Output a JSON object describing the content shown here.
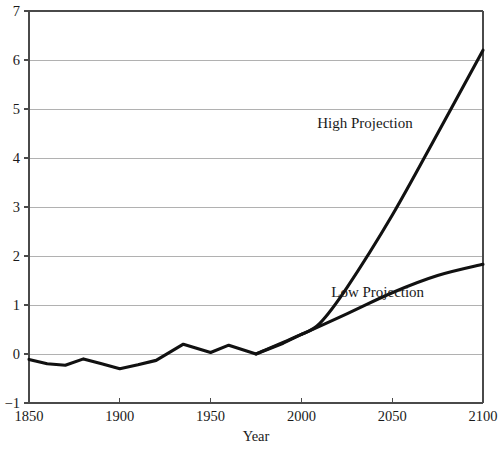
{
  "chart_data": {
    "type": "line",
    "title": "",
    "subtitle": "",
    "xlabel": "Year",
    "ylabel": "",
    "xlim": [
      1850,
      2100
    ],
    "ylim": [
      -1,
      7
    ],
    "grid": true,
    "grid_axis": "y",
    "legend_position": "inline-annotation",
    "x_ticks": [
      1850,
      1900,
      1950,
      2000,
      2050,
      2100
    ],
    "x_tick_labels": [
      "1850",
      "1900",
      "1950",
      "2000",
      "2050",
      "2100"
    ],
    "y_ticks": [
      -1,
      0,
      1,
      2,
      3,
      4,
      5,
      6,
      7
    ],
    "y_tick_labels": [
      "−1",
      "0",
      "1",
      "2",
      "3",
      "4",
      "5",
      "6",
      "7"
    ],
    "line_color": "#111111",
    "gridline_color": "#a9a9a9",
    "axis_color": "#4a4a4a",
    "background_color": "#ffffff",
    "series": [
      {
        "name": "Observed",
        "annotation": "",
        "x": [
          1850,
          1860,
          1870,
          1880,
          1890,
          1900,
          1910,
          1920,
          1935,
          1950,
          1960,
          1975,
          1990,
          2000
        ],
        "values": [
          -0.11,
          -0.2,
          -0.23,
          -0.1,
          -0.2,
          -0.3,
          -0.22,
          -0.13,
          0.2,
          0.03,
          0.18,
          0.0,
          0.22,
          0.4
        ]
      },
      {
        "name": "High Projection",
        "annotation": "High Projection",
        "annotation_x": 2035,
        "annotation_y": 4.62,
        "x": [
          2000,
          2010,
          2025,
          2050,
          2075,
          2100
        ],
        "values": [
          0.4,
          0.62,
          1.35,
          2.83,
          4.5,
          6.2
        ]
      },
      {
        "name": "Low Projection",
        "annotation": "Low Projection",
        "annotation_x": 2042,
        "annotation_y": 1.17,
        "x": [
          1975,
          2000,
          2025,
          2050,
          2075,
          2100
        ],
        "values": [
          0.0,
          0.4,
          0.82,
          1.25,
          1.6,
          1.83
        ]
      }
    ]
  }
}
